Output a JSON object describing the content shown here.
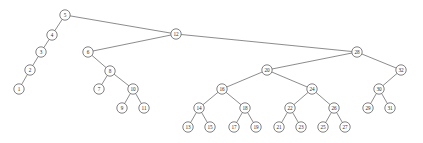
{
  "figure": {
    "kind": "binary-search-tree-diagram",
    "background_color": "#ffffff",
    "node_fill_color": "#ffffff",
    "node_stroke_color": "#4a4a4a",
    "edge_color": "#5a5a5a",
    "label_color": "#2b2b2b",
    "width": 423,
    "height": 143
  },
  "chart_data": {
    "type": "diagram",
    "title": "",
    "root": "5",
    "node_count": 32,
    "nodes": [
      {
        "id": "5",
        "label": "5",
        "x": 65,
        "y": 15
      },
      {
        "id": "4",
        "label": "4",
        "x": 52,
        "y": 35
      },
      {
        "id": "3",
        "label": "3",
        "x": 41,
        "y": 52
      },
      {
        "id": "2",
        "label": "2",
        "x": 30,
        "y": 70
      },
      {
        "id": "1",
        "label": "1",
        "x": 19,
        "y": 89
      },
      {
        "id": "12",
        "label": "12",
        "x": 176,
        "y": 34
      },
      {
        "id": "6",
        "label": "6",
        "x": 88,
        "y": 52
      },
      {
        "id": "8",
        "label": "8",
        "x": 110,
        "y": 71
      },
      {
        "id": "7",
        "label": "7",
        "x": 99,
        "y": 89
      },
      {
        "id": "10",
        "label": "10",
        "x": 133,
        "y": 89
      },
      {
        "id": "9",
        "label": "9",
        "x": 122,
        "y": 108
      },
      {
        "id": "11",
        "label": "11",
        "x": 144,
        "y": 108
      },
      {
        "id": "28",
        "label": "28",
        "x": 357,
        "y": 52
      },
      {
        "id": "20",
        "label": "20",
        "x": 267,
        "y": 70
      },
      {
        "id": "16",
        "label": "16",
        "x": 222,
        "y": 89
      },
      {
        "id": "14",
        "label": "14",
        "x": 199,
        "y": 108
      },
      {
        "id": "13",
        "label": "13",
        "x": 188,
        "y": 127
      },
      {
        "id": "15",
        "label": "15",
        "x": 210,
        "y": 127
      },
      {
        "id": "18",
        "label": "18",
        "x": 245,
        "y": 108
      },
      {
        "id": "17",
        "label": "17",
        "x": 234,
        "y": 127
      },
      {
        "id": "19",
        "label": "19",
        "x": 256,
        "y": 127
      },
      {
        "id": "24",
        "label": "24",
        "x": 312,
        "y": 89
      },
      {
        "id": "22",
        "label": "22",
        "x": 290,
        "y": 108
      },
      {
        "id": "21",
        "label": "21",
        "x": 279,
        "y": 127
      },
      {
        "id": "23",
        "label": "23",
        "x": 301,
        "y": 127
      },
      {
        "id": "26",
        "label": "26",
        "x": 334,
        "y": 108
      },
      {
        "id": "25",
        "label": "25",
        "x": 323,
        "y": 127
      },
      {
        "id": "27",
        "label": "27",
        "x": 345,
        "y": 127
      },
      {
        "id": "32",
        "label": "32",
        "x": 401,
        "y": 70
      },
      {
        "id": "30",
        "label": "30",
        "x": 379,
        "y": 89
      },
      {
        "id": "29",
        "label": "29",
        "x": 368,
        "y": 108
      },
      {
        "id": "31",
        "label": "31",
        "x": 390,
        "y": 108
      }
    ],
    "edges": [
      {
        "from": "5",
        "to": "4"
      },
      {
        "from": "5",
        "to": "12"
      },
      {
        "from": "4",
        "to": "3"
      },
      {
        "from": "3",
        "to": "2"
      },
      {
        "from": "2",
        "to": "1"
      },
      {
        "from": "12",
        "to": "6"
      },
      {
        "from": "12",
        "to": "28"
      },
      {
        "from": "6",
        "to": "8"
      },
      {
        "from": "8",
        "to": "7"
      },
      {
        "from": "8",
        "to": "10"
      },
      {
        "from": "10",
        "to": "9"
      },
      {
        "from": "10",
        "to": "11"
      },
      {
        "from": "28",
        "to": "20"
      },
      {
        "from": "28",
        "to": "32"
      },
      {
        "from": "20",
        "to": "16"
      },
      {
        "from": "20",
        "to": "24"
      },
      {
        "from": "16",
        "to": "14"
      },
      {
        "from": "16",
        "to": "18"
      },
      {
        "from": "14",
        "to": "13"
      },
      {
        "from": "14",
        "to": "15"
      },
      {
        "from": "18",
        "to": "17"
      },
      {
        "from": "18",
        "to": "19"
      },
      {
        "from": "24",
        "to": "22"
      },
      {
        "from": "24",
        "to": "26"
      },
      {
        "from": "22",
        "to": "21"
      },
      {
        "from": "22",
        "to": "23"
      },
      {
        "from": "26",
        "to": "25"
      },
      {
        "from": "26",
        "to": "27"
      },
      {
        "from": "32",
        "to": "30"
      },
      {
        "from": "30",
        "to": "29"
      },
      {
        "from": "30",
        "to": "31"
      }
    ],
    "node_radius": 5.2
  }
}
